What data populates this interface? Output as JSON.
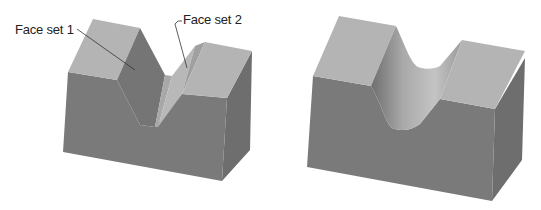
{
  "figure": {
    "left_model": {
      "description": "V-notch block",
      "labels": [
        {
          "text": "Face set 1",
          "x": 15,
          "y": 22
        },
        {
          "text": "Face set 2",
          "x": 183,
          "y": 12
        }
      ]
    },
    "right_model": {
      "description": "Block with rounded (filleted) groove"
    },
    "colors": {
      "top_face": "#b4b4b4",
      "front_face": "#7a7a7a",
      "side_face": "#6e6e6e",
      "notch_face_dark": "#757575",
      "notch_face_light": "#b8b8b8",
      "leader_line": "#333333"
    }
  }
}
